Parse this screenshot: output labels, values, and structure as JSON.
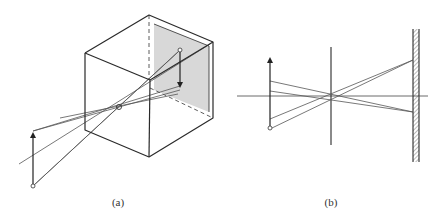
{
  "figure": {
    "panels": [
      {
        "id": "a",
        "label": "(a)",
        "description": "Pinhole camera box with inverted image projected on back wall"
      },
      {
        "id": "b",
        "label": "(b)",
        "description": "Side view: object arrow, pinhole/aperture, screen with inverted image"
      }
    ]
  },
  "colors": {
    "line": "#2a2a2a",
    "ray": "#555555",
    "panel_fill": "#d8d8d8",
    "background": "#ffffff"
  }
}
